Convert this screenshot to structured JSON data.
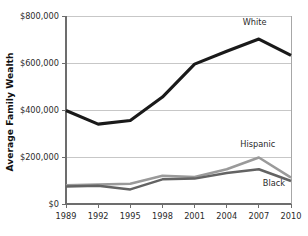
{
  "chart_data": {
    "type": "line",
    "title": "",
    "xlabel": "",
    "ylabel": "Average Family Wealth",
    "x": [
      1989,
      1992,
      1995,
      1998,
      2001,
      2004,
      2007,
      2010
    ],
    "xtick_labels": [
      "1989",
      "1992",
      "1995",
      "1998",
      "2001",
      "2004",
      "2007",
      "2010"
    ],
    "ytick_labels": [
      "$800,000",
      "$600,000",
      "$400,000",
      "$200,000",
      "$0"
    ],
    "ytick_values": [
      800000,
      600000,
      400000,
      200000,
      0
    ],
    "ylim": [
      0,
      800000
    ],
    "xlim": [
      1989,
      2010
    ],
    "grid": true,
    "legend_position": "inline-annotations",
    "series": [
      {
        "name": "White",
        "color": "#1a1a1a",
        "width": 3.1,
        "values": [
          398000,
          340000,
          355000,
          455000,
          595000,
          650000,
          702000,
          632000
        ],
        "label": "White",
        "label_x": 2006.6,
        "label_y": 762000
      },
      {
        "name": "Hispanic",
        "color": "#9a9a9a",
        "width": 2.5,
        "values": [
          80000,
          83000,
          86000,
          120000,
          115000,
          148000,
          198000,
          112000
        ],
        "label": "Hispanic",
        "label_x": 2006.9,
        "label_y": 244000
      },
      {
        "name": "Black",
        "color": "#636363",
        "width": 2.5,
        "values": [
          75000,
          78000,
          62000,
          105000,
          108000,
          132000,
          148000,
          98000
        ],
        "label": "Black",
        "label_x": 2008.4,
        "label_y": 78000
      }
    ]
  }
}
